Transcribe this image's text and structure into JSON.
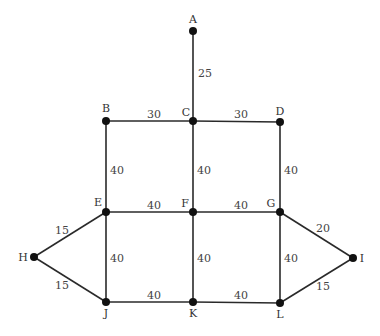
{
  "graph": {
    "nodes": [
      {
        "id": "A",
        "x": 193,
        "y": 31,
        "lx": 193,
        "ly": 23,
        "anchor": "middle"
      },
      {
        "id": "B",
        "x": 106,
        "y": 121,
        "lx": 106,
        "ly": 112,
        "anchor": "middle"
      },
      {
        "id": "C",
        "x": 193,
        "y": 121,
        "lx": 186,
        "ly": 116,
        "anchor": "middle"
      },
      {
        "id": "D",
        "x": 280,
        "y": 122,
        "lx": 280,
        "ly": 115,
        "anchor": "middle"
      },
      {
        "id": "E",
        "x": 106,
        "y": 212,
        "lx": 98,
        "ly": 206,
        "anchor": "middle"
      },
      {
        "id": "F",
        "x": 193,
        "y": 212,
        "lx": 185,
        "ly": 207,
        "anchor": "middle"
      },
      {
        "id": "G",
        "x": 280,
        "y": 212,
        "lx": 271,
        "ly": 207,
        "anchor": "middle"
      },
      {
        "id": "H",
        "x": 34,
        "y": 257,
        "lx": 23,
        "ly": 261,
        "anchor": "middle"
      },
      {
        "id": "I",
        "x": 353,
        "y": 258,
        "lx": 362,
        "ly": 262,
        "anchor": "middle"
      },
      {
        "id": "J",
        "x": 106,
        "y": 302,
        "lx": 106,
        "ly": 317,
        "anchor": "middle"
      },
      {
        "id": "K",
        "x": 193,
        "y": 302,
        "lx": 193,
        "ly": 317,
        "anchor": "middle"
      },
      {
        "id": "L",
        "x": 280,
        "y": 303,
        "lx": 280,
        "ly": 318,
        "anchor": "middle"
      }
    ],
    "edges": [
      {
        "from": "A",
        "to": "C",
        "weight": "25",
        "wx": 198,
        "wy": 77
      },
      {
        "from": "B",
        "to": "C",
        "weight": "30",
        "wx": 147,
        "wy": 118
      },
      {
        "from": "C",
        "to": "D",
        "weight": "30",
        "wx": 234,
        "wy": 118
      },
      {
        "from": "B",
        "to": "E",
        "weight": "40",
        "wx": 110,
        "wy": 174
      },
      {
        "from": "C",
        "to": "F",
        "weight": "40",
        "wx": 197,
        "wy": 174
      },
      {
        "from": "D",
        "to": "G",
        "weight": "40",
        "wx": 284,
        "wy": 174
      },
      {
        "from": "E",
        "to": "F",
        "weight": "40",
        "wx": 147,
        "wy": 209
      },
      {
        "from": "F",
        "to": "G",
        "weight": "40",
        "wx": 234,
        "wy": 209
      },
      {
        "from": "E",
        "to": "H",
        "weight": "15",
        "wx": 55,
        "wy": 234
      },
      {
        "from": "H",
        "to": "J",
        "weight": "15",
        "wx": 55,
        "wy": 289
      },
      {
        "from": "E",
        "to": "J",
        "weight": "40",
        "wx": 110,
        "wy": 262
      },
      {
        "from": "F",
        "to": "K",
        "weight": "40",
        "wx": 197,
        "wy": 262
      },
      {
        "from": "G",
        "to": "L",
        "weight": "40",
        "wx": 284,
        "wy": 262
      },
      {
        "from": "G",
        "to": "I",
        "weight": "20",
        "wx": 316,
        "wy": 232
      },
      {
        "from": "L",
        "to": "I",
        "weight": "15",
        "wx": 316,
        "wy": 290
      },
      {
        "from": "J",
        "to": "K",
        "weight": "40",
        "wx": 147,
        "wy": 299
      },
      {
        "from": "K",
        "to": "L",
        "weight": "40",
        "wx": 234,
        "wy": 299
      }
    ]
  }
}
